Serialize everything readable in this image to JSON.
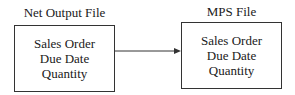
{
  "diagram": {
    "nodes": [
      {
        "id": "net-output-file",
        "title": "Net Output File",
        "fields": [
          "Sales Order",
          "Due Date",
          "Quantity"
        ]
      },
      {
        "id": "mps-file",
        "title": "MPS File",
        "fields": [
          "Sales Order",
          "Due Date",
          "Quantity"
        ]
      }
    ],
    "edges": [
      {
        "from": "net-output-file",
        "to": "mps-file",
        "style": "solid-arrow"
      }
    ],
    "colors": {
      "line": "#333333",
      "text": "#1a1a1a",
      "background": "#ffffff"
    }
  }
}
